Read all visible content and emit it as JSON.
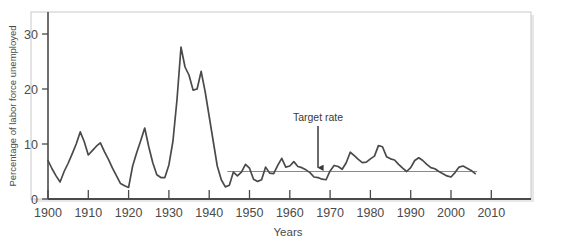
{
  "chart_data": {
    "type": "line",
    "title": "",
    "xlabel": "Years",
    "ylabel": "Percentage of labor force unemployed",
    "xlim": [
      1900,
      2012
    ],
    "ylim": [
      0,
      34
    ],
    "xticks": [
      1900,
      1910,
      1920,
      1930,
      1940,
      1950,
      1960,
      1970,
      1980,
      1990,
      2000,
      2010
    ],
    "xtick_labels": [
      "1900",
      "1910",
      "1920",
      "1930",
      "1940",
      "1950",
      "1960",
      "1970",
      "1980",
      "1990",
      "2000",
      "2010"
    ],
    "yticks": [
      0,
      10,
      20,
      30
    ],
    "ytick_labels": [
      "0",
      "10",
      "20",
      "30"
    ],
    "grid": false,
    "legend": "none",
    "series": [
      {
        "name": "Unemployment rate",
        "color": "#4a4a4a",
        "x": [
          1900,
          1901,
          1902,
          1903,
          1904,
          1905,
          1906,
          1907,
          1908,
          1909,
          1910,
          1911,
          1912,
          1913,
          1914,
          1915,
          1916,
          1917,
          1918,
          1919,
          1920,
          1921,
          1922,
          1923,
          1924,
          1925,
          1926,
          1927,
          1928,
          1929,
          1930,
          1931,
          1932,
          1933,
          1934,
          1935,
          1936,
          1937,
          1938,
          1939,
          1940,
          1941,
          1942,
          1943,
          1944,
          1945,
          1946,
          1947,
          1948,
          1949,
          1950,
          1951,
          1952,
          1953,
          1954,
          1955,
          1956,
          1957,
          1958,
          1959,
          1960,
          1961,
          1962,
          1963,
          1964,
          1965,
          1966,
          1967,
          1968,
          1969,
          1970,
          1971,
          1972,
          1973,
          1974,
          1975,
          1976,
          1977,
          1978,
          1979,
          1980,
          1981,
          1982,
          1983,
          1984,
          1985,
          1986,
          1987,
          1988,
          1989,
          1990,
          1991,
          1992,
          1993,
          1994,
          1995,
          1996,
          1997,
          1998,
          1999,
          2000,
          2001,
          2002,
          2003,
          2004,
          2005,
          2006
        ],
        "values": [
          7.0,
          5.5,
          4.2,
          3.1,
          5.0,
          6.5,
          8.2,
          10.0,
          12.2,
          10.4,
          8.0,
          8.8,
          9.6,
          10.2,
          8.6,
          7.2,
          5.6,
          4.2,
          2.8,
          2.4,
          2.1,
          6.0,
          8.4,
          10.6,
          12.9,
          9.5,
          6.6,
          4.4,
          3.9,
          3.9,
          6.2,
          10.5,
          18.0,
          27.6,
          24.0,
          22.5,
          19.8,
          20.0,
          23.2,
          19.5,
          15.0,
          10.5,
          6.0,
          3.5,
          2.2,
          2.5,
          4.9,
          4.2,
          4.9,
          6.3,
          5.6,
          3.6,
          3.2,
          3.5,
          5.8,
          4.7,
          4.6,
          6.1,
          7.4,
          5.8,
          6.0,
          6.8,
          5.9,
          5.7,
          5.3,
          4.8,
          4.0,
          3.9,
          3.6,
          3.5,
          5.1,
          6.1,
          5.9,
          5.4,
          6.6,
          8.5,
          7.9,
          7.2,
          6.6,
          6.7,
          7.3,
          7.8,
          9.7,
          9.5,
          7.7,
          7.3,
          7.1,
          6.3,
          5.6,
          5.0,
          5.7,
          7.0,
          7.5,
          7.0,
          6.3,
          5.7,
          5.5,
          5.0,
          4.6,
          4.2,
          4.0,
          4.8,
          5.8,
          6.0,
          5.6,
          5.2,
          4.6
        ]
      },
      {
        "name": "Target rate",
        "color": "#8a8a8a",
        "type": "hline",
        "value": 5.0,
        "x_start": 1944.5,
        "x_end": 2006.5
      }
    ],
    "annotations": [
      {
        "label": "Target rate",
        "text_x": 1967,
        "text_y": 14.2,
        "arrow_to_x": 1967,
        "arrow_to_y": 5.3,
        "arrow": "down"
      }
    ]
  },
  "axes": {
    "ylabel": "Percentage of labor force unemployed",
    "xlabel": "Years"
  },
  "annotation": {
    "target_rate_label": "Target rate"
  },
  "colors": {
    "line": "#4a4a4a",
    "target_line": "#8a8a8a",
    "axis": "#4a4a4a",
    "frame": "#c9c9c9",
    "background": "#ffffff",
    "text": "#4a4a4a"
  }
}
